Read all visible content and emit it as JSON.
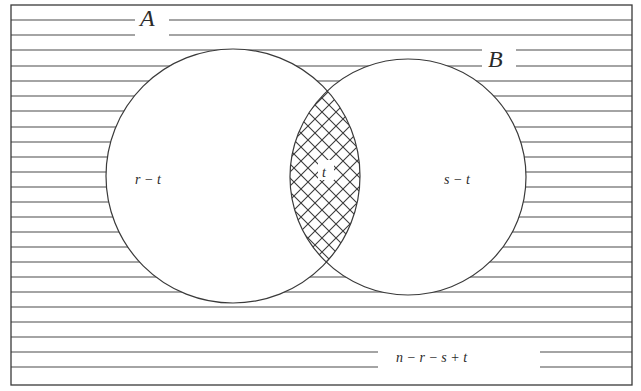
{
  "diagram": {
    "type": "venn",
    "sets": [
      {
        "id": "A",
        "label": "A",
        "region_label": "r − t"
      },
      {
        "id": "B",
        "label": "B",
        "region_label": "s − t"
      }
    ],
    "intersection_label": "t",
    "outside_label": "n − r − s + t",
    "colors": {
      "stroke": "#3a3a3a",
      "background": "#ffffff"
    },
    "hatching": {
      "outside": "horizontal-lines",
      "intersection": "crosshatch"
    }
  }
}
